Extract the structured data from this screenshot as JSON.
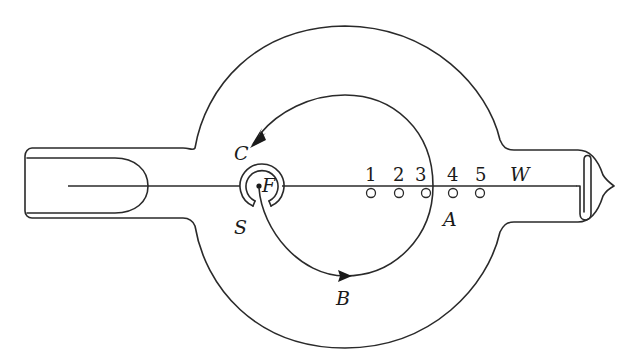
{
  "figure": {
    "type": "schematic of magnetron / electron-tube apparatus",
    "colors": {
      "ink": "#2a2a2a",
      "background": "#ffffff"
    }
  },
  "labels": {
    "C": "C",
    "F": "F",
    "S": "S",
    "A": "A",
    "B": "B",
    "W": "W"
  },
  "probes": [
    {
      "label": "1"
    },
    {
      "label": "2"
    },
    {
      "label": "3"
    },
    {
      "label": "4"
    },
    {
      "label": "5"
    }
  ],
  "components": {
    "outer_envelope": "glass bulb (large circle with side tubes)",
    "left_tube": "cylindrical side arm with inner electrode",
    "right_tube": "side arm with sealed tip and loop electrode",
    "source": "filament F inside split cylinder S/C",
    "electron_path": "circular trajectory with arrows (B below, arrow at top)",
    "axis_wire": "central horizontal wire W"
  }
}
